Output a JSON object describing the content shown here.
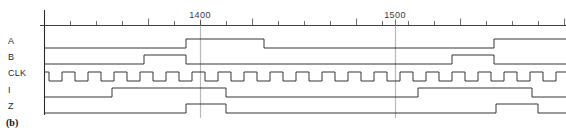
{
  "figure": {
    "caption": "(b)",
    "type": "digital-timing-diagram"
  },
  "labels": {
    "a": "A",
    "b": "B",
    "clk": "CLK",
    "i": "I",
    "z": "Z"
  },
  "axis": {
    "tick_labels": [
      "1400",
      "1500"
    ],
    "tick_label_1": "1400",
    "tick_label_2": "1500",
    "minor_tick_count": 21,
    "cursor_count": 2
  },
  "colors": {
    "waveform": "#2b2b2b",
    "axis": "#2b2b2b",
    "cursor": "#b9b9b9",
    "label_text": "#2a2a2a",
    "background": "#ffffff"
  },
  "chart_data": {
    "type": "line",
    "title": "",
    "xlabel": "",
    "ylabel": "",
    "grid": false,
    "legend_position": "left",
    "x_axis": {
      "pixel_origin": 44,
      "pixel_end": 566,
      "tick_spacing_px": 26,
      "labeled_ticks": [
        {
          "label": "1400",
          "x_px": 200
        },
        {
          "label": "1500",
          "x_px": 395
        }
      ],
      "major_tick_x_px": [
        44
      ],
      "minor_tick_x_px": [
        70,
        96,
        122,
        148,
        174,
        200,
        226,
        252,
        278,
        304,
        330,
        356,
        382,
        408,
        434,
        460,
        486,
        512,
        538,
        564
      ]
    },
    "cursors_x_px": [
      200,
      395
    ],
    "row_baselines_px": {
      "A": 48,
      "B": 64,
      "CLK": 81,
      "I": 97,
      "Z": 113
    },
    "signal_amplitude_px": 9,
    "series": [
      {
        "name": "A",
        "baseline_y_px": 48,
        "initial_level": 0,
        "transitions": [
          {
            "x_px": 186,
            "level": 1
          },
          {
            "x_px": 264,
            "level": 0
          },
          {
            "x_px": 494,
            "level": 1
          }
        ]
      },
      {
        "name": "B",
        "baseline_y_px": 64,
        "initial_level": 0,
        "transitions": [
          {
            "x_px": 144,
            "level": 1
          },
          {
            "x_px": 186,
            "level": 0
          },
          {
            "x_px": 452,
            "level": 1
          },
          {
            "x_px": 494,
            "level": 0
          }
        ]
      },
      {
        "name": "CLK",
        "baseline_y_px": 81,
        "initial_level": 1,
        "period_px": 26,
        "duty_cycle": 0.5,
        "transitions": [
          {
            "x_px": 49,
            "level": 0
          },
          {
            "x_px": 62,
            "level": 1
          },
          {
            "x_px": 75,
            "level": 0
          },
          {
            "x_px": 88,
            "level": 1
          },
          {
            "x_px": 101,
            "level": 0
          },
          {
            "x_px": 114,
            "level": 1
          },
          {
            "x_px": 127,
            "level": 0
          },
          {
            "x_px": 140,
            "level": 1
          },
          {
            "x_px": 153,
            "level": 0
          },
          {
            "x_px": 166,
            "level": 1
          },
          {
            "x_px": 179,
            "level": 0
          },
          {
            "x_px": 192,
            "level": 1
          },
          {
            "x_px": 205,
            "level": 0
          },
          {
            "x_px": 218,
            "level": 1
          },
          {
            "x_px": 231,
            "level": 0
          },
          {
            "x_px": 244,
            "level": 1
          },
          {
            "x_px": 257,
            "level": 0
          },
          {
            "x_px": 270,
            "level": 1
          },
          {
            "x_px": 283,
            "level": 0
          },
          {
            "x_px": 296,
            "level": 1
          },
          {
            "x_px": 309,
            "level": 0
          },
          {
            "x_px": 322,
            "level": 1
          },
          {
            "x_px": 335,
            "level": 0
          },
          {
            "x_px": 348,
            "level": 1
          },
          {
            "x_px": 361,
            "level": 0
          },
          {
            "x_px": 374,
            "level": 1
          },
          {
            "x_px": 387,
            "level": 0
          },
          {
            "x_px": 400,
            "level": 1
          },
          {
            "x_px": 413,
            "level": 0
          },
          {
            "x_px": 426,
            "level": 1
          },
          {
            "x_px": 439,
            "level": 0
          },
          {
            "x_px": 452,
            "level": 1
          },
          {
            "x_px": 465,
            "level": 0
          },
          {
            "x_px": 478,
            "level": 1
          },
          {
            "x_px": 491,
            "level": 0
          },
          {
            "x_px": 504,
            "level": 1
          },
          {
            "x_px": 517,
            "level": 0
          },
          {
            "x_px": 530,
            "level": 1
          },
          {
            "x_px": 543,
            "level": 0
          },
          {
            "x_px": 556,
            "level": 1
          }
        ]
      },
      {
        "name": "I",
        "baseline_y_px": 97,
        "initial_level": 0,
        "transitions": [
          {
            "x_px": 112,
            "level": 1
          },
          {
            "x_px": 226,
            "level": 0
          },
          {
            "x_px": 418,
            "level": 1
          },
          {
            "x_px": 532,
            "level": 0
          }
        ]
      },
      {
        "name": "Z",
        "baseline_y_px": 113,
        "initial_level": 0,
        "transitions": [
          {
            "x_px": 186,
            "level": 1
          },
          {
            "x_px": 226,
            "level": 0
          },
          {
            "x_px": 496,
            "level": 1
          },
          {
            "x_px": 538,
            "level": 0
          }
        ]
      }
    ]
  }
}
